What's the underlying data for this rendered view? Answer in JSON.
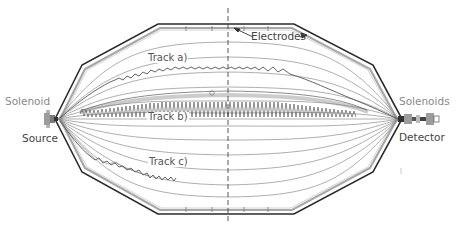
{
  "labels": {
    "solenoid_left": "Solenoid",
    "solenoids_right": "Solenoids",
    "source": "Source",
    "detector": "Detector",
    "electrodes": "Electrodes",
    "track_a": "Track a)",
    "track_b": "Track b)",
    "track_c": "Track c)"
  },
  "colors": {
    "outer_wall": "#2b2b2b",
    "inner_electrode": "#9a9a9a",
    "field_lines": "#8c8c8c",
    "track": "#555555",
    "track_b_helix": "#6e6e6e",
    "dashed_center": "#444444",
    "solenoid_block": "#9c9c9c"
  },
  "geometry": {
    "center_x": 228,
    "axis_y": 119,
    "left_apex_x": 55,
    "right_apex_x": 402
  }
}
